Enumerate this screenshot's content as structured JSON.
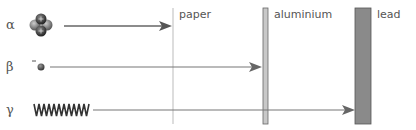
{
  "diagram": {
    "title": "",
    "radiation": [
      {
        "symbol": "α",
        "name": "alpha-particle",
        "icon": "helium-nucleus-icon",
        "stopped_by": "paper"
      },
      {
        "symbol": "β",
        "charge": "−",
        "name": "beta-particle",
        "icon": "electron-icon",
        "stopped_by": "aluminium"
      },
      {
        "symbol": "γ",
        "name": "gamma-ray",
        "icon": "wave-icon",
        "stopped_by": "lead"
      }
    ],
    "barriers": [
      {
        "label": "paper"
      },
      {
        "label": "aluminium"
      },
      {
        "label": "lead"
      }
    ],
    "colors": {
      "line": "#666666",
      "aluminium_fill": "#c8c8c8",
      "lead_fill": "#8a8a8a",
      "paper_line": "#bbbbbb"
    }
  }
}
